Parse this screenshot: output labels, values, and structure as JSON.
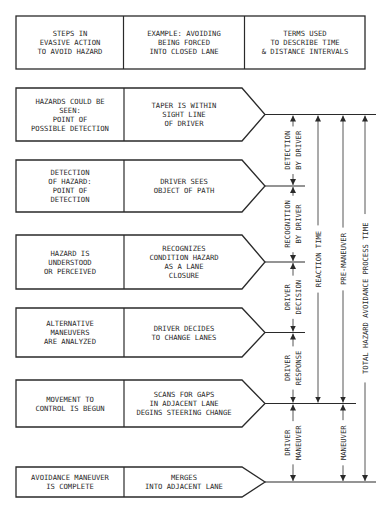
{
  "header": {
    "columns": [
      [
        "STEPS IN",
        "EVASIVE ACTION",
        "TO AVOID HAZARD"
      ],
      [
        "EXAMPLE:  AVOIDING",
        "BEING FORCED",
        "INTO CLOSED LANE"
      ],
      [
        "TERMS USED",
        "TO DESCRIBE TIME",
        "& DISTANCE INTERVALS"
      ]
    ]
  },
  "steps": [
    {
      "step": [
        "HAZARDS COULD BE",
        "SEEN:",
        "POINT OF",
        "POSSIBLE DETECTION"
      ],
      "example": [
        "TAPER IS WITHIN",
        "SIGHT LINE",
        "OF DRIVER"
      ]
    },
    {
      "step": [
        "DETECTION",
        "OF HAZARD:",
        "POINT OF",
        "DETECTION"
      ],
      "example": [
        "DRIVER SEES",
        "OBJECT OF PATH"
      ]
    },
    {
      "step": [
        "HAZARD IS",
        "UNDERSTOOD",
        "OR PERCEIVED"
      ],
      "example": [
        "RECOGNIZES",
        "CONDITION HAZARD",
        "AS A LANE",
        "CLOSURE"
      ]
    },
    {
      "step": [
        "ALTERNATIVE",
        "MANEUVERS",
        "ARE ANALYZED"
      ],
      "example": [
        "DRIVER DECIDES",
        "TO CHANGE LANES"
      ]
    },
    {
      "step": [
        "MOVEMENT TO",
        "CONTROL IS BEGUN"
      ],
      "example": [
        "SCANS FOR GAPS",
        "IN ADJACENT LANE",
        "DEGINS STEERING CHANGE"
      ]
    },
    {
      "step": [
        "AVOIDANCE MANEUVER",
        "IS COMPLETE"
      ],
      "example": [
        "MERGES",
        "INTO ADJACENT LANE"
      ]
    }
  ],
  "intervals": {
    "phases": [
      {
        "lines": [
          "DETECTION",
          "BY DRIVER"
        ],
        "from_step": 1,
        "to_step": 2
      },
      {
        "lines": [
          "RECOGNITION",
          "BY DRIVER"
        ],
        "from_step": 2,
        "to_step": 3
      },
      {
        "lines": [
          "DRIVER",
          "DECISION"
        ],
        "from_step": 3,
        "to_step": 4
      },
      {
        "lines": [
          "DRIVER",
          "RESPONSE"
        ],
        "from_step": 4,
        "to_step": 5
      },
      {
        "lines": [
          "DRIVER",
          "MANEUVER"
        ],
        "from_step": 5,
        "to_step": 6
      }
    ],
    "spans": [
      {
        "label": "REACTION TIME",
        "from_step": 1,
        "to_step": 5
      },
      {
        "label": "PRE-MANEUVER",
        "from_step": 1,
        "to_step": 5
      },
      {
        "label": "MANEUVER",
        "from_step": 5,
        "to_step": 6
      },
      {
        "label": "TOTAL HAZARD AVOIDANCE  PROCESS TIME",
        "from_step": 1,
        "to_step": 6
      }
    ]
  }
}
